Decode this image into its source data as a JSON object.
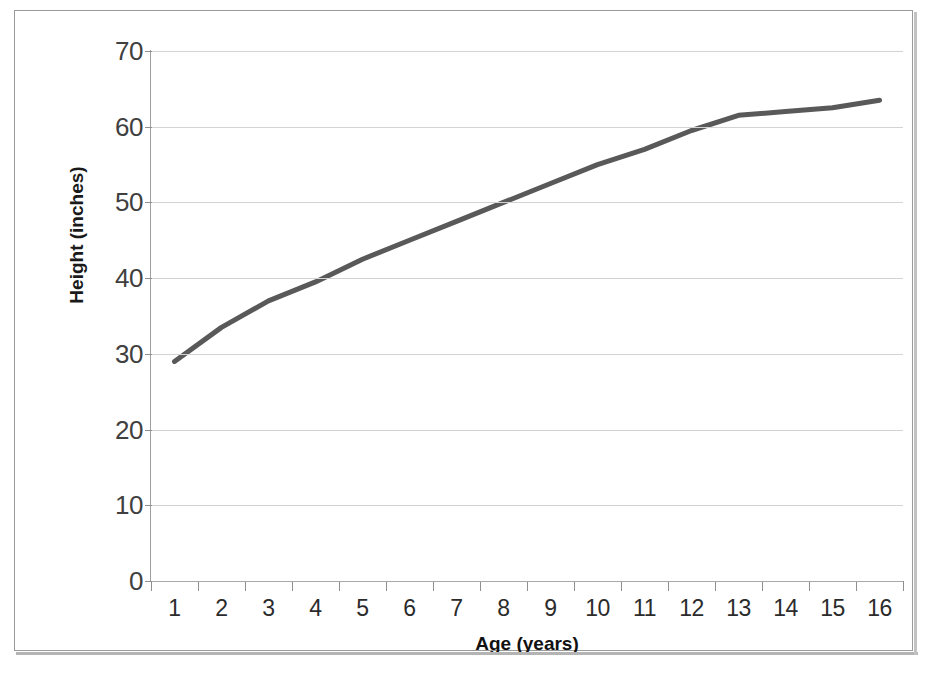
{
  "chart_data": {
    "type": "line",
    "title": "",
    "xlabel": "Age (years)",
    "ylabel": "Height (inches)",
    "x": [
      1,
      2,
      3,
      4,
      5,
      6,
      7,
      8,
      9,
      10,
      11,
      12,
      13,
      14,
      15,
      16
    ],
    "categories": [
      "1",
      "2",
      "3",
      "4",
      "5",
      "6",
      "7",
      "8",
      "9",
      "10",
      "11",
      "12",
      "13",
      "14",
      "15",
      "16"
    ],
    "series": [
      {
        "name": "Height",
        "values": [
          29.0,
          33.5,
          37.0,
          39.5,
          42.5,
          45.0,
          47.5,
          50.0,
          52.5,
          55.0,
          57.0,
          59.5,
          61.5,
          62.0,
          62.5,
          63.5
        ]
      }
    ],
    "xlim": [
      1,
      16
    ],
    "ylim": [
      0,
      70
    ],
    "ytick_values": [
      0,
      10,
      20,
      30,
      40,
      50,
      60,
      70
    ],
    "ytick_labels": [
      "0",
      "10",
      "20",
      "30",
      "40",
      "50",
      "60",
      "70"
    ],
    "grid": true,
    "grid_axis": "y",
    "legend": false,
    "legend_position": "none",
    "line_color": "#595959",
    "line_width": 5,
    "grid_color": "#d3d3d3",
    "axis_color": "#8f8f8f",
    "background_color": "#ffffff",
    "border_color": "#9a9a9a"
  }
}
